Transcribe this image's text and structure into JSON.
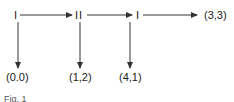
{
  "diagram": {
    "type": "extensive-form game tree",
    "nodes": [
      {
        "id": "n1",
        "player": "I"
      },
      {
        "id": "n2",
        "player": "II"
      },
      {
        "id": "n3",
        "player": "I"
      }
    ],
    "payoffs": {
      "down_1": "(0.0)",
      "down_2": "(1,2)",
      "down_3": "(4,1)",
      "terminal": "(3,3)"
    },
    "caption": "Fig. 1",
    "colors": {
      "line": "#333333",
      "text": "#222222",
      "background": "#ffffff"
    }
  }
}
